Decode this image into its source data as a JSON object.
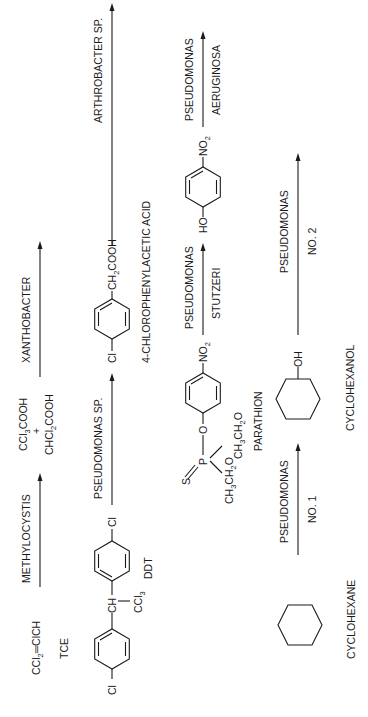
{
  "figure": {
    "type": "biodegradation-pathways",
    "orientation": "rotated-90-ccw",
    "rows": [
      {
        "id": "tce",
        "substrate_formula_parts": [
          "CCl",
          "2",
          "═ClCH"
        ],
        "substrate_name": "TCE",
        "organism_line1": "METHYLOCYSTIS",
        "organism_line2": "",
        "intermediate_formula_1": [
          "CCl",
          "3",
          "COOH"
        ],
        "intermediate_plus": "+",
        "intermediate_formula_2": [
          "CHCl",
          "2",
          "COOH"
        ],
        "organism2_line1": "XANTHOBACTER",
        "organism2_line2": ""
      },
      {
        "id": "ddt",
        "substrate_name": "DDT",
        "substrate_labels": {
          "left_cl": "Cl",
          "right_cl": "Cl",
          "ch": "CH",
          "ccl3": [
            "CCl",
            "3"
          ]
        },
        "organism_line1": "PSEUDOMONAS SP.",
        "organism_line2": "",
        "product_name": "4-CHLOROPHENYLACETIC ACID",
        "product_labels": {
          "cl": "Cl",
          "ch2cooh": [
            "CH",
            "2",
            "COOH"
          ]
        },
        "organism2_line1": "ARTHROBACTER SP.",
        "organism2_line2": ""
      },
      {
        "id": "parathion",
        "substrate_name": "PARATHION",
        "substrate_labels": {
          "s": "S",
          "p": "P",
          "o": "O",
          "ethoxy_1": [
            "CH",
            "3",
            "CH",
            "2",
            "O"
          ],
          "ethoxy_2": [
            "CH",
            "3",
            "CH",
            "2",
            "O"
          ],
          "no2": [
            "NO",
            "2"
          ]
        },
        "organism_line1": "PSEUDOMONAS",
        "organism_line2": "STUTZERI",
        "product_labels": {
          "ho": "HO",
          "no2": [
            "NO",
            "2"
          ]
        },
        "organism2_line1": "PSEUDOMONAS",
        "organism2_line2": "AERUGINOSA"
      },
      {
        "id": "cyclohexane",
        "substrate_name": "CYCLOHEXANE",
        "organism_line1": "PSEUDOMONAS",
        "organism_line2": "NO. 1",
        "product_name": "CYCLOHEXANOL",
        "product_labels": {
          "oh": "OH"
        },
        "organism2_line1": "PSEUDOMONAS",
        "organism2_line2": "NO. 2"
      }
    ]
  },
  "colors": {
    "ink": "#1a1a1a",
    "background": "#ffffff"
  }
}
